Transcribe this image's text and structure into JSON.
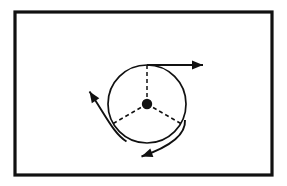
{
  "figure": {
    "canvas": {
      "width": 287,
      "height": 186,
      "background": "#ffffff"
    },
    "frame": {
      "name": "figure-border",
      "x": 15,
      "y": 12,
      "width": 257,
      "height": 163,
      "stroke": "#111111",
      "stroke_width": 3.2,
      "fill": "#ffffff"
    },
    "circle": {
      "name": "disk-outline",
      "cx": 147,
      "cy": 104,
      "r": 39,
      "stroke": "#111111",
      "stroke_width": 1.7,
      "fill": "none"
    },
    "center_dot": {
      "name": "rotation-center",
      "cx": 147,
      "cy": 104,
      "r": 5.2,
      "fill": "#111111"
    },
    "radii": [
      {
        "name": "radius-up",
        "angle_deg": 90,
        "x1": 147,
        "y1": 104,
        "x2": 147,
        "y2": 65,
        "stroke": "#111111",
        "stroke_width": 1.5,
        "dash": "4 3"
      },
      {
        "name": "radius-lower-left",
        "angle_deg": 210,
        "x1": 147,
        "y1": 104,
        "x2": 113.2,
        "y2": 123.5,
        "stroke": "#111111",
        "stroke_width": 1.5,
        "dash": "4 3"
      },
      {
        "name": "radius-lower-right",
        "angle_deg": 330,
        "x1": 147,
        "y1": 104,
        "x2": 180.8,
        "y2": 123.5,
        "stroke": "#111111",
        "stroke_width": 1.5,
        "dash": "4 3"
      }
    ],
    "arrows": [
      {
        "name": "velocity-arrow-top-right",
        "direction": "right",
        "path": "M 147 65 L 203 65",
        "tip_x": 203,
        "tip_y": 65,
        "stroke": "#111111",
        "stroke_width": 1.9,
        "head_length": 11,
        "head_width": 9
      },
      {
        "name": "velocity-arrow-upper-left",
        "direction": "upper-left",
        "path": "M 126.5 141.5 C 114 134 106 116 89.5 91.5",
        "tip_x": 89.5,
        "tip_y": 91.5,
        "stroke": "#111111",
        "stroke_width": 1.9,
        "head_length": 11,
        "head_width": 9
      },
      {
        "name": "velocity-arrow-lower-left",
        "direction": "lower-left",
        "path": "M 185 120 C 186 134 172 146 141.5 156.5",
        "tip_x": 141.5,
        "tip_y": 156.5,
        "stroke": "#111111",
        "stroke_width": 1.9,
        "head_length": 11,
        "head_width": 9
      }
    ]
  }
}
